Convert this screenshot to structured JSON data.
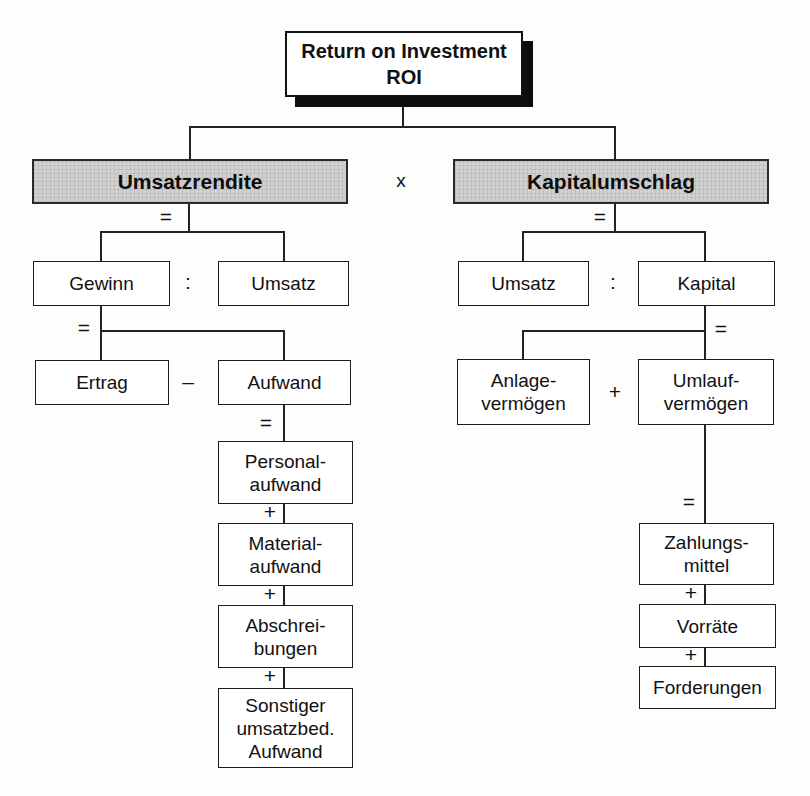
{
  "meta": {
    "description_language": "German",
    "diagram_type": "ROI tree (DuPont scheme)"
  },
  "colors": {
    "background": "#fdfdfc",
    "line": "#222222",
    "box_border": "#1c1c1c",
    "box_fill": "#ffffff",
    "header_fill": "#d2d2d2",
    "root_shadow": "#0d0d0d",
    "text": "#111111"
  },
  "root": {
    "title": "Return on Investment\nROI"
  },
  "operators": {
    "multiply": "x"
  },
  "left": {
    "header": "Umsatzrendite",
    "eq_header": "=",
    "row1": {
      "a": "Gewinn",
      "op": ":",
      "b": "Umsatz"
    },
    "eq_row1": "=",
    "row2": {
      "a": "Ertrag",
      "op": "–",
      "b": "Aufwand"
    },
    "eq_row2": "=",
    "plus": "+",
    "chain": [
      "Personal-\naufwand",
      "Material-\naufwand",
      "Abschrei-\nbungen",
      "Sonstiger\numsatzbed.\nAufwand"
    ]
  },
  "right": {
    "header": "Kapitalumschlag",
    "eq_header": "=",
    "row1": {
      "a": "Umsatz",
      "op": ":",
      "b": "Kapital"
    },
    "eq_row1": "=",
    "row2": {
      "a": "Anlage-\nvermögen",
      "op": "+",
      "b": "Umlauf-\nvermögen"
    },
    "eq_row2": "=",
    "plus": "+",
    "chain": [
      "Zahlungs-\nmittel",
      "Vorräte",
      "Forderungen"
    ]
  }
}
